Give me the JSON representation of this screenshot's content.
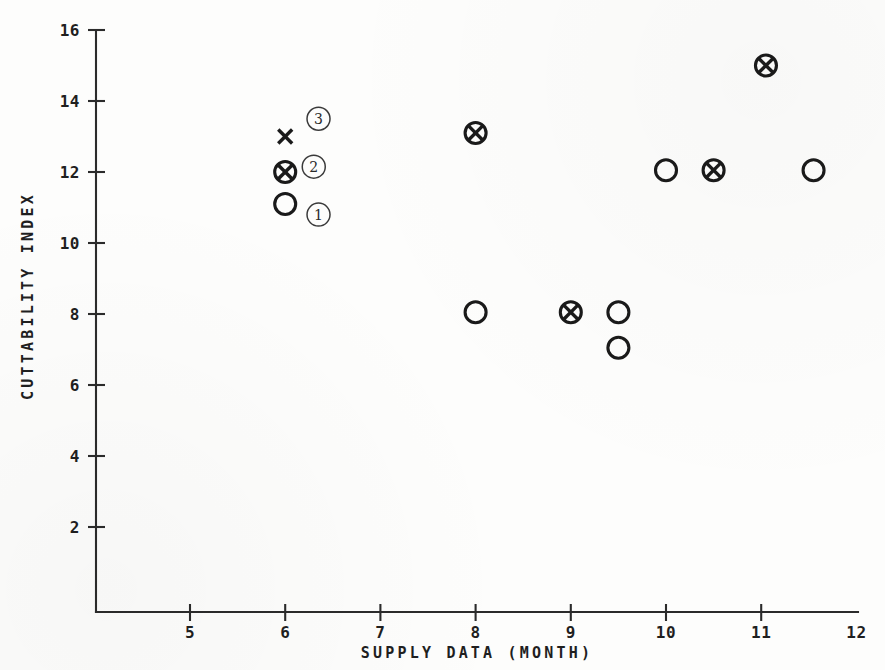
{
  "chart_data": {
    "type": "scatter",
    "title": "",
    "xlabel": "SUPPLY DATA (MONTH)",
    "ylabel": "CUTTABILITY INDEX",
    "xlim": [
      4.3,
      12.0
    ],
    "ylim": [
      0.0,
      16.3
    ],
    "xticks": [
      5,
      6,
      7,
      8,
      9,
      10,
      11,
      12
    ],
    "xtick_labels": [
      "5",
      "6",
      "7",
      "8",
      "9",
      "10",
      "11",
      "12"
    ],
    "yticks": [
      2,
      4,
      6,
      8,
      10,
      12,
      14,
      16
    ],
    "ytick_labels": [
      "2",
      "4",
      "6",
      "8",
      "10",
      "12",
      "14",
      "16"
    ],
    "grid": false,
    "legend_position": "inline-annotations",
    "marker_types": [
      {
        "key": "cross",
        "symbol": "x",
        "annotation": "3"
      },
      {
        "key": "circled-cross",
        "symbol": "circle-with-x",
        "annotation": "2"
      },
      {
        "key": "open-circle",
        "symbol": "circle",
        "annotation": "1"
      }
    ],
    "series": [
      {
        "name": "open-circle",
        "marker": "open-circle",
        "points": [
          {
            "x": 6.0,
            "y": 11.1
          },
          {
            "x": 8.0,
            "y": 8.05
          },
          {
            "x": 9.5,
            "y": 8.05
          },
          {
            "x": 9.5,
            "y": 7.05
          },
          {
            "x": 10.0,
            "y": 12.05
          },
          {
            "x": 11.55,
            "y": 12.05
          }
        ]
      },
      {
        "name": "circled-cross",
        "marker": "circled-cross",
        "points": [
          {
            "x": 6.0,
            "y": 12.0
          },
          {
            "x": 8.0,
            "y": 13.1
          },
          {
            "x": 9.0,
            "y": 8.05
          },
          {
            "x": 10.5,
            "y": 12.05
          },
          {
            "x": 11.05,
            "y": 15.0
          }
        ]
      },
      {
        "name": "cross",
        "marker": "cross",
        "points": [
          {
            "x": 6.0,
            "y": 13.0
          }
        ]
      }
    ],
    "annotations": [
      {
        "label": "3",
        "x": 6.35,
        "y": 13.5
      },
      {
        "label": "2",
        "x": 6.3,
        "y": 12.15
      },
      {
        "label": "1",
        "x": 6.35,
        "y": 10.8
      }
    ],
    "colors": {
      "marker": "#1a1a1a",
      "axis": "#2b2b2b",
      "background": "#fdfdfc"
    }
  }
}
